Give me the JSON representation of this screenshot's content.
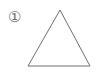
{
  "figure": {
    "width": 98,
    "height": 72,
    "background_color": "#ffffff",
    "stroke_color": "#6e6e6e",
    "stroke_width": 1,
    "label": {
      "text": "①",
      "plain_value": "1",
      "style": "circled-number",
      "color": "#6b6b6b",
      "center_x": 15.5,
      "center_y": 17.5,
      "diameter": 13
    },
    "shape": {
      "name": "triangle",
      "kind": "polygon",
      "filled": false,
      "fill_color": "none",
      "points": "60,10 90,66 28,66",
      "vertices": [
        {
          "name": "apex",
          "x": 60,
          "y": 10
        },
        {
          "name": "bottom-right",
          "x": 90,
          "y": 66
        },
        {
          "name": "bottom-left",
          "x": 28,
          "y": 66
        }
      ]
    }
  }
}
